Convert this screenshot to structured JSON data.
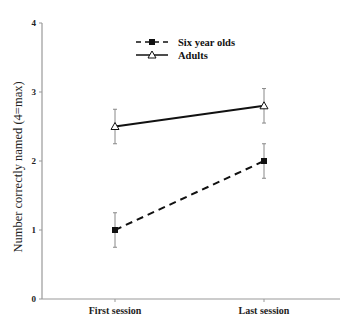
{
  "chart_data": {
    "type": "line",
    "title": "",
    "xlabel": "",
    "ylabel": "Number correctly named (4=max)",
    "categories": [
      "First session",
      "Last session"
    ],
    "ylim": [
      0,
      4
    ],
    "yticks": [
      "0",
      "1",
      "2",
      "3",
      "4"
    ],
    "grid": false,
    "legend_position": "top-center",
    "series": [
      {
        "name": "Six year olds",
        "values": [
          1.0,
          2.0
        ],
        "errors": [
          0.25,
          0.25
        ],
        "line_style": "dashed",
        "marker": "filled-square",
        "color": "#111111"
      },
      {
        "name": "Adults",
        "values": [
          2.5,
          2.8
        ],
        "errors": [
          0.25,
          0.25
        ],
        "line_style": "solid",
        "marker": "open-triangle",
        "color": "#111111"
      }
    ]
  },
  "colors": {
    "axis": "#999999",
    "errorbar": "#888888",
    "line": "#111111"
  }
}
